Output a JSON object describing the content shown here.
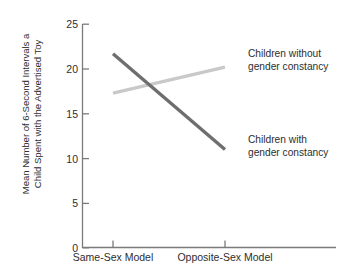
{
  "chart_data": {
    "type": "line",
    "title": "",
    "subtitle": "",
    "xlabel": "",
    "ylabel": "Mean Number of 6-Second Intervals a Child Spent with the Advertised Toy",
    "ylabel_lines": [
      "Mean Number of 6-Second Intervals a",
      "Child Spent with the Advertised Toy"
    ],
    "categories": [
      "Same-Sex Model",
      "Opposite-Sex Model"
    ],
    "ylim": [
      0,
      25
    ],
    "yticks": [
      0,
      5,
      10,
      15,
      20,
      25
    ],
    "ytick_labels": [
      "0",
      "5",
      "10",
      "15",
      "20",
      "25"
    ],
    "grid": false,
    "legend_position": "inline-right",
    "series": [
      {
        "name": "Children without gender constancy",
        "name_lines": [
          "Children without",
          "gender constancy"
        ],
        "values": [
          17.3,
          20.2
        ],
        "color": "#c9c9c9"
      },
      {
        "name": "Children with gender constancy",
        "name_lines": [
          "Children with",
          "gender constancy"
        ],
        "values": [
          21.7,
          11.0
        ],
        "color": "#6e6e6e"
      }
    ],
    "annotations": [
      "Children without gender constancy",
      "Children with gender constancy"
    ]
  },
  "axis": {
    "axis_color": "#7a7a7a",
    "text_color": "#2e2e2e"
  }
}
